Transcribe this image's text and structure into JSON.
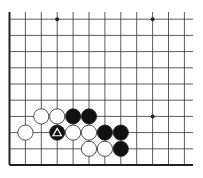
{
  "board": {
    "description": "Go board fragment, lower-left corner",
    "grid": {
      "origin_x": 9.5,
      "bottom_y": 165,
      "spacing_x": 15.9,
      "spacing_y": 16.2,
      "columns": 12,
      "rows": 10,
      "right_extent": 193,
      "top_extent": 12
    },
    "colors": {
      "line": "#333333",
      "edge": "#222222",
      "black": "#111111",
      "white": "#ffffff",
      "background": "#ffffff"
    },
    "star_points": [
      {
        "col": 3,
        "row": 9
      },
      {
        "col": 9,
        "row": 9
      },
      {
        "col": 9,
        "row": 3
      }
    ],
    "stones": [
      {
        "col": 2,
        "row": 3,
        "color": "white"
      },
      {
        "col": 3,
        "row": 3,
        "color": "white"
      },
      {
        "col": 4,
        "row": 3,
        "color": "black"
      },
      {
        "col": 5,
        "row": 3,
        "color": "black"
      },
      {
        "col": 1,
        "row": 2,
        "color": "white"
      },
      {
        "col": 3,
        "row": 2,
        "color": "black",
        "marker": "triangle"
      },
      {
        "col": 4,
        "row": 2,
        "color": "white"
      },
      {
        "col": 5,
        "row": 2,
        "color": "white"
      },
      {
        "col": 6,
        "row": 2,
        "color": "black"
      },
      {
        "col": 7,
        "row": 2,
        "color": "black"
      },
      {
        "col": 5,
        "row": 1,
        "color": "white"
      },
      {
        "col": 6,
        "row": 1,
        "color": "white"
      },
      {
        "col": 7,
        "row": 1,
        "color": "black"
      }
    ]
  }
}
